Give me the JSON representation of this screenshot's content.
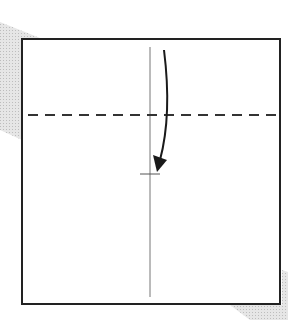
{
  "diagram": {
    "type": "origami-fold-step",
    "colors": {
      "background": "#ffffff",
      "paper_fill": "#ffffff",
      "paper_edge": "#222222",
      "crease": "#777777",
      "fold_line": "#333333",
      "arrow": "#1a1a1a",
      "shadow": "#d9d9d9"
    },
    "paper": {
      "x": 22,
      "y": 39,
      "width": 258,
      "height": 265
    },
    "center_crease": {
      "x": 150,
      "y1": 47,
      "y2": 297
    },
    "valley_fold_line": {
      "y": 115,
      "x1": 28,
      "x2": 279,
      "style": "dashed"
    },
    "target_mark": {
      "x": 150,
      "y": 174,
      "half_width": 10
    },
    "fold_arrow": {
      "from": [
        164,
        50
      ],
      "to": [
        158,
        170
      ],
      "direction": "down"
    }
  }
}
